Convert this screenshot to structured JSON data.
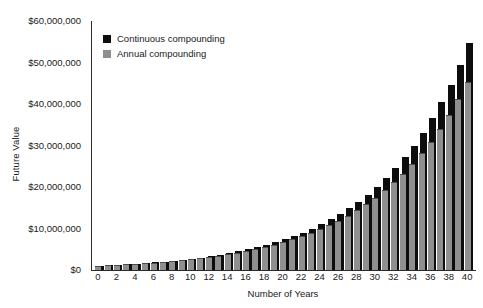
{
  "chart_data": {
    "type": "bar",
    "title": "",
    "xlabel": "Number of Years",
    "ylabel": "Future Value",
    "grid": false,
    "legend_position": "top-left",
    "x": [
      0,
      1,
      2,
      3,
      4,
      5,
      6,
      7,
      8,
      9,
      10,
      11,
      12,
      13,
      14,
      15,
      16,
      17,
      18,
      19,
      20,
      21,
      22,
      23,
      24,
      25,
      26,
      27,
      28,
      29,
      30,
      31,
      32,
      33,
      34,
      35,
      36,
      37,
      38,
      39,
      40
    ],
    "categories": [
      "0",
      "1",
      "2",
      "3",
      "4",
      "5",
      "6",
      "7",
      "8",
      "9",
      "10",
      "11",
      "12",
      "13",
      "14",
      "15",
      "16",
      "17",
      "18",
      "19",
      "20",
      "21",
      "22",
      "23",
      "24",
      "25",
      "26",
      "27",
      "28",
      "29",
      "30",
      "31",
      "32",
      "33",
      "34",
      "35",
      "36",
      "37",
      "38",
      "39",
      "40"
    ],
    "xtick_labels": [
      "0",
      "2",
      "4",
      "6",
      "8",
      "10",
      "12",
      "14",
      "16",
      "18",
      "20",
      "22",
      "24",
      "26",
      "28",
      "30",
      "32",
      "34",
      "36",
      "38",
      "40"
    ],
    "xtick_values": [
      0,
      2,
      4,
      6,
      8,
      10,
      12,
      14,
      16,
      18,
      20,
      22,
      24,
      26,
      28,
      30,
      32,
      34,
      36,
      38,
      40
    ],
    "ytick_labels": [
      "$0",
      "$10,000,000",
      "$20,000,000",
      "$30,000,000",
      "$40,000,000",
      "$50,000,000",
      "$60,000,000"
    ],
    "ytick_values": [
      0,
      10000000,
      20000000,
      30000000,
      40000000,
      50000000,
      60000000
    ],
    "ylim": [
      0,
      60000000
    ],
    "xlim": [
      -0.5,
      40.5
    ],
    "series": [
      {
        "name": "Continuous compounding",
        "color": "#0d0d0d",
        "values": [
          1000000,
          1105171,
          1221403,
          1349859,
          1491825,
          1648721,
          1822119,
          2013753,
          2225541,
          2459603,
          2718282,
          3004166,
          3320117,
          3669297,
          4055200,
          4481689,
          4953032,
          5473947,
          6049647,
          6685894,
          7389056,
          8166170,
          9025013,
          9974182,
          11023176,
          12182494,
          13463738,
          14879732,
          16444647,
          18174145,
          20085537,
          22197951,
          24532530,
          27112639,
          29964100,
          33115452,
          36598234,
          40447304,
          44701184,
          49402449,
          54598150
        ]
      },
      {
        "name": "Annual compounding",
        "color": "#8f8f8f",
        "values": [
          1000000,
          1100000,
          1210000,
          1331000,
          1464100,
          1610510,
          1771561,
          1948717,
          2143589,
          2357948,
          2593742,
          2853117,
          3138428,
          3452271,
          3797498,
          4177248,
          4594973,
          5054470,
          5559917,
          6115909,
          6727500,
          7400250,
          8140275,
          8954302,
          9849733,
          10834706,
          11918177,
          13110994,
          14422094,
          15863304,
          17449402,
          19194342,
          21113777,
          23225154,
          25547670,
          28102437,
          30912681,
          34003949,
          37404343,
          41144778,
          45259256
        ]
      }
    ],
    "annotations": []
  },
  "legend": {
    "items": [
      {
        "label": "Continuous compounding",
        "color": "#0d0d0d"
      },
      {
        "label": "Annual compounding",
        "color": "#8f8f8f"
      }
    ]
  }
}
